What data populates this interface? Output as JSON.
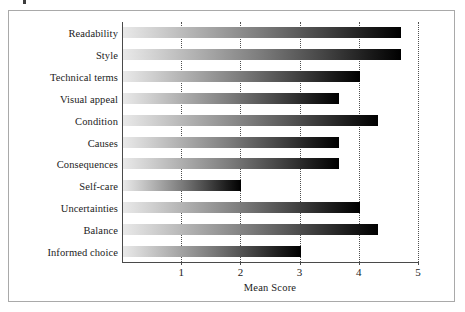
{
  "figure": {
    "background_color": "#ffffff",
    "frame_color": "#a9a9a9",
    "axis_color": "#4a4a4a",
    "bar_gradient_start": "#e9e9e9",
    "bar_gradient_end": "#000000"
  },
  "chart_data": {
    "type": "bar",
    "orientation": "horizontal",
    "title": "",
    "xlabel": "Mean Score",
    "ylabel": "",
    "xlim": [
      0,
      5
    ],
    "xticks": [
      1,
      2,
      3,
      4,
      5
    ],
    "xtick_labels": [
      "1",
      "2",
      "3",
      "4",
      "5"
    ],
    "grid": "vertical-dotted",
    "legend": "none",
    "categories": [
      "Readability",
      "Style",
      "Technical terms",
      "Visual appeal",
      "Condition",
      "Causes",
      "Consequences",
      "Self-care",
      "Uncertainties",
      "Balance",
      "Informed choice"
    ],
    "values": [
      4.7,
      4.7,
      4.0,
      3.65,
      4.3,
      3.65,
      3.65,
      2.0,
      4.0,
      4.3,
      3.0
    ]
  }
}
